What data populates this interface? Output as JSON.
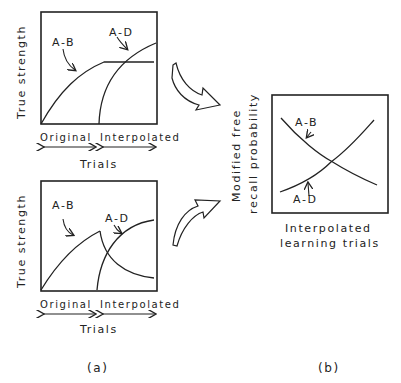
{
  "panel_a": {
    "top": {
      "ylabel": "True strength",
      "curve_labels": {
        "ab": "A-B",
        "ad": "A-D"
      },
      "x_phase_labels": {
        "original": "Original",
        "interpolated": "Interpolated"
      },
      "xlabel": "Trials"
    },
    "bottom": {
      "ylabel": "True strength",
      "curve_labels": {
        "ab": "A-B",
        "ad": "A-D"
      },
      "x_phase_labels": {
        "original": "Original",
        "interpolated": "Interpolated"
      },
      "xlabel": "Trials"
    },
    "caption": "(a)"
  },
  "panel_b": {
    "ylabel_line1": "Modified free",
    "ylabel_line2": "recall probability",
    "xlabel_line1": "Interpolated",
    "xlabel_line2": "learning trials",
    "curve_labels": {
      "ab": "A-B",
      "ad": "A-D"
    },
    "caption": "(b)"
  },
  "colors": {
    "ink": "#222222",
    "background": "#ffffff"
  }
}
